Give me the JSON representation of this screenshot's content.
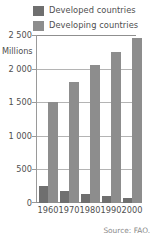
{
  "chart_data": {
    "type": "bar",
    "title": "",
    "subtitle": "",
    "xlabel": "",
    "ylabel": "Millions",
    "unit_label": "Millions",
    "categories": [
      "1960",
      "1970",
      "1980",
      "1990",
      "2000"
    ],
    "series": [
      {
        "name": "Developed countries",
        "color": "#6f6f6f",
        "values": [
          250,
          175,
          135,
          110,
          75
        ]
      },
      {
        "name": "Developing countries",
        "color": "#8d8d8d",
        "values": [
          1500,
          1800,
          2050,
          2250,
          2450
        ]
      }
    ],
    "ylim": [
      0,
      2500
    ],
    "y_ticks": [
      0,
      500,
      1000,
      1500,
      2000,
      2500
    ],
    "y_tick_labels": [
      "0",
      "500",
      "1 000",
      "1 500",
      "2 000",
      "2 500"
    ],
    "grid": true,
    "legend_position": "top"
  },
  "legend": {
    "items": [
      {
        "label": "Developed countries",
        "color": "#6f6f6f"
      },
      {
        "label": "Developing countries",
        "color": "#8d8d8d"
      }
    ]
  },
  "axes": {
    "y_labels": [
      "2 500",
      "2 000",
      "1 500",
      "1 000",
      "500",
      "0"
    ],
    "x_labels": [
      "1960",
      "1970",
      "1980",
      "1990",
      "2000"
    ],
    "unit": "Millions"
  },
  "footer": {
    "source": "Source: FAO."
  },
  "colors": {
    "developed": "#6f6f6f",
    "developing": "#8d8d8d",
    "gridline": "#b4b4b4",
    "axis": "#8f8f8f",
    "text": "#4f4f4f",
    "source_text": "#8a8a8a",
    "background": "#ffffff"
  }
}
